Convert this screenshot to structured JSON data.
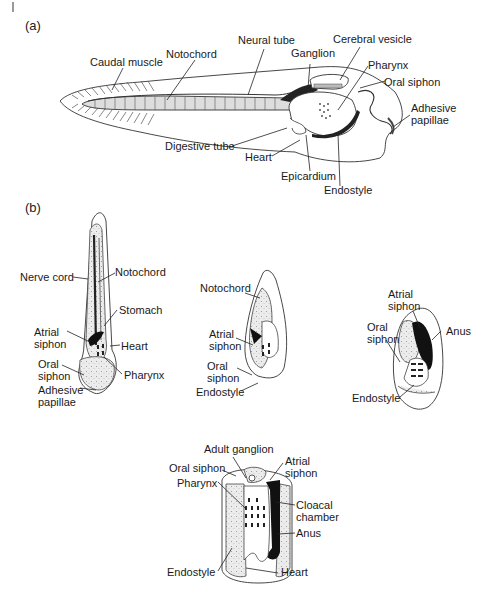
{
  "figure": {
    "panel_a_label": "(a)",
    "panel_b_label": "(b)"
  },
  "larva": {
    "labels": {
      "caudal_muscle": "Caudal muscle",
      "notochord": "Notochord",
      "neural_tube": "Neural tube",
      "ganglion": "Ganglion",
      "cerebral_vesicle": "Cerebral vesicle",
      "pharynx": "Pharynx",
      "oral_siphon": "Oral siphon",
      "adhesive_papillae": "Adhesive\npapillae",
      "digestive_tube": "Digestive tube",
      "heart": "Heart",
      "epicardium": "Epicardium",
      "endostyle": "Endostyle"
    }
  },
  "stage1": {
    "labels": {
      "nerve_cord": "Nerve cord",
      "notochord": "Notochord",
      "stomach": "Stomach",
      "atrial_siphon": "Atrial\nsiphon",
      "heart": "Heart",
      "oral_siphon": "Oral\nsiphon",
      "pharynx": "Pharynx",
      "adhesive_papillae": "Adhesive\npapillae"
    }
  },
  "stage2": {
    "labels": {
      "notochord": "Notochord",
      "atrial_siphon": "Atrial\nsiphon",
      "oral_siphon": "Oral\nsiphon",
      "endostyle": "Endostyle"
    }
  },
  "stage3": {
    "labels": {
      "atrial_siphon": "Atrial\nsiphon",
      "oral_siphon": "Oral\nsiphon",
      "anus": "Anus",
      "endostyle": "Endostyle"
    }
  },
  "adult": {
    "labels": {
      "adult_ganglion": "Adult ganglion",
      "oral_siphon": "Oral siphon",
      "atrial_siphon": "Atrial\nsiphon",
      "pharynx": "Pharynx",
      "cloacal_chamber": "Cloacal\nchamber",
      "anus": "Anus",
      "endostyle": "Endostyle",
      "heart": "Heart"
    }
  }
}
